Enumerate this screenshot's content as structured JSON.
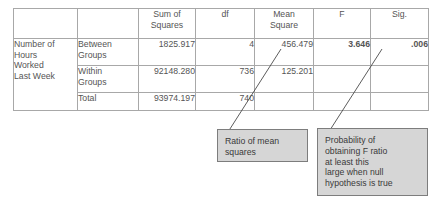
{
  "table": {
    "headers": {
      "corner_blank": "",
      "source_blank": "",
      "sum_of_squares": {
        "line1": "Sum of",
        "line2": "Squares"
      },
      "df": "df",
      "mean_square": {
        "line1": "Mean",
        "line2": "Square"
      },
      "f": "F",
      "sig": "Sig."
    },
    "dependent_variable": "Number of\nHours\nWorked\nLast Week",
    "rows": [
      {
        "source": "Between\nGroups",
        "sum_of_squares": "1825.917",
        "df": "4",
        "mean_square": "456.479",
        "f": "3.646",
        "sig": ".006"
      },
      {
        "source": "Within\nGroups",
        "sum_of_squares": "92148.280",
        "df": "736",
        "mean_square": "125.201",
        "f": "",
        "sig": ""
      },
      {
        "source": "Total",
        "sum_of_squares": "93974.197",
        "df": "740",
        "mean_square": "",
        "f": "",
        "sig": ""
      }
    ]
  },
  "annotations": {
    "ratio_of_mean_squares": "Ratio of mean\nsquares",
    "probability_of_f": "Probability of\nobtaining F ratio\nat least this\nlarge when null\nhypothesis is true"
  },
  "colors": {
    "callout_fill": "#d6d6d6",
    "callout_border": "#7d7d7d",
    "table_border": "#8a8a8a",
    "grid_line": "#a8a8a8",
    "text": "#555555",
    "bold_text": "#1b1b1b",
    "leader_line": "#4a4a4a"
  }
}
